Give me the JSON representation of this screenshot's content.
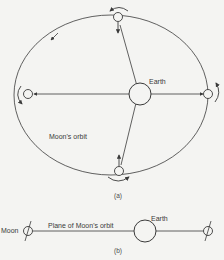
{
  "figure_a": {
    "earth_label": "Earth",
    "orbit_label": "Moon's orbit",
    "caption": "(a)"
  },
  "figure_b": {
    "moon_label": "Moon",
    "plane_label": "Plane of Moon's orbit",
    "earth_label": "Earth",
    "caption": "(b)"
  },
  "colors": {
    "stroke": "#3a3a3a",
    "background": "#f4f4f2"
  }
}
